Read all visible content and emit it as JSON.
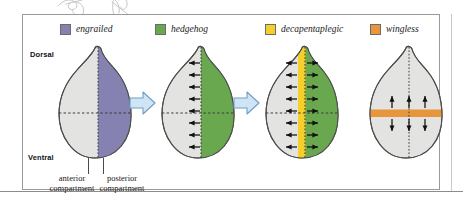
{
  "figure": {
    "title_visible": false,
    "background": "#ffffff",
    "frame_color": "#9a9a9a"
  },
  "legend": {
    "items": [
      {
        "label": "engrailed",
        "color": "#8581b0",
        "icon": "color-swatch"
      },
      {
        "label": "hedgehog",
        "color": "#6aa84f",
        "icon": "color-swatch"
      },
      {
        "label": "decapentaplegic",
        "color": "#f5d02c",
        "icon": "color-swatch"
      },
      {
        "label": "wingless",
        "color": "#e8963c",
        "icon": "color-swatch"
      }
    ]
  },
  "axis_labels": {
    "dorsal": "Dorsal",
    "ventral": "Ventral"
  },
  "compartment_captions": {
    "anterior_line1": "anterior",
    "anterior_line2": "compartment",
    "posterior_line1": "posterior",
    "posterior_line2": "compartment"
  },
  "colors": {
    "disc_fill": "#e3e3e1",
    "disc_outline": "#4d4d4d",
    "engrailed": "#8581b0",
    "hedgehog": "#6aa84f",
    "decapentaplegic": "#f5d02c",
    "wingless": "#e8963c",
    "arrow_black": "#111111",
    "transition_arrow_fill": "#cfe4f5",
    "transition_arrow_stroke": "#6f9dc4",
    "dashed_line": "#333333"
  },
  "panels": [
    {
      "id": "panel-engrailed",
      "gene": "engrailed",
      "fill_region": "posterior-compartment",
      "fill_color": "#8581b0",
      "signal_arrows": 0,
      "arrow_direction": "none",
      "stripe": "none"
    },
    {
      "id": "panel-hedgehog",
      "gene": "hedgehog",
      "fill_region": "posterior-compartment",
      "fill_color": "#6aa84f",
      "signal_arrows": 8,
      "arrow_direction": "left",
      "stripe": "none"
    },
    {
      "id": "panel-decapentaplegic",
      "gene": "decapentaplegic",
      "fill_region": "posterior-compartment",
      "fill_color": "#6aa84f",
      "signal_arrows": 16,
      "arrow_direction": "bidirectional-horizontal",
      "stripe": "vertical",
      "stripe_color": "#f5d02c"
    },
    {
      "id": "panel-wingless",
      "gene": "wingless",
      "fill_region": "none",
      "fill_color": "#e3e3e1",
      "signal_arrows": 3,
      "arrow_direction": "bidirectional-vertical",
      "stripe": "horizontal",
      "stripe_color": "#e8963c"
    }
  ],
  "transitions": [
    {
      "from": "panel-engrailed",
      "to": "panel-hedgehog",
      "icon": "right-arrow-icon"
    },
    {
      "from": "panel-hedgehog",
      "to": "panel-decapentaplegic",
      "icon": "right-arrow-icon"
    }
  ]
}
